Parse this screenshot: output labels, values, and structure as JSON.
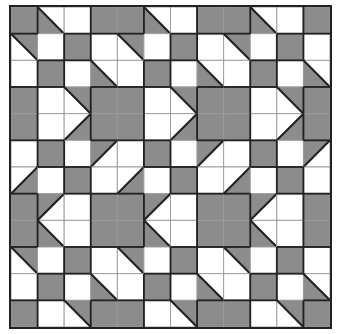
{
  "figure": {
    "type": "quilt-tessellation-pattern",
    "rows": 12,
    "cols": 12,
    "colors": {
      "gray": "#8c8c8c",
      "white": "#ffffff",
      "grid_line": "#9a9a9a",
      "shape_line": "#222222"
    },
    "legend": {
      "G": "solid gray square",
      "W": "solid white square",
      "dBL": "diagonal top-left to bottom-right, gray lower-left half",
      "dTR": "diagonal top-left to bottom-right, gray upper-right half",
      "fTL": "diagonal bottom-left to top-right, gray upper-left half",
      "fBR": "diagonal bottom-left to top-right, gray lower-right half"
    },
    "grid": [
      [
        "G",
        "dBL",
        "W",
        "G",
        "G",
        "dBL",
        "W",
        "G",
        "G",
        "dBL",
        "W",
        "G"
      ],
      [
        "dTR",
        "W",
        "G",
        "W",
        "dTR",
        "W",
        "G",
        "W",
        "dTR",
        "W",
        "G",
        "W"
      ],
      [
        "W",
        "G",
        "W",
        "dBL",
        "W",
        "G",
        "W",
        "dBL",
        "W",
        "G",
        "W",
        "dBL"
      ],
      [
        "G",
        "W",
        "dTR",
        "G",
        "G",
        "W",
        "dTR",
        "G",
        "G",
        "W",
        "dTR",
        "G"
      ],
      [
        "G",
        "W",
        "fBR",
        "G",
        "G",
        "W",
        "fBR",
        "G",
        "G",
        "W",
        "fBR",
        "G"
      ],
      [
        "W",
        "G",
        "W",
        "fTL",
        "W",
        "G",
        "W",
        "fTL",
        "W",
        "G",
        "W",
        "fTL"
      ],
      [
        "fBR",
        "W",
        "G",
        "W",
        "fBR",
        "W",
        "G",
        "W",
        "fBR",
        "W",
        "G",
        "W"
      ],
      [
        "G",
        "fTL",
        "W",
        "G",
        "G",
        "fTL",
        "W",
        "G",
        "G",
        "fTL",
        "W",
        "G"
      ],
      [
        "G",
        "dBL",
        "W",
        "G",
        "G",
        "dBL",
        "W",
        "G",
        "G",
        "dBL",
        "W",
        "G"
      ],
      [
        "dTR",
        "W",
        "G",
        "W",
        "dTR",
        "W",
        "G",
        "W",
        "dTR",
        "W",
        "G",
        "W"
      ],
      [
        "W",
        "G",
        "W",
        "dBL",
        "W",
        "G",
        "W",
        "dBL",
        "W",
        "G",
        "W",
        "dBL"
      ],
      [
        "G",
        "W",
        "dTR",
        "G",
        "G",
        "W",
        "dTR",
        "G",
        "G",
        "W",
        "dTR",
        "G"
      ]
    ]
  }
}
